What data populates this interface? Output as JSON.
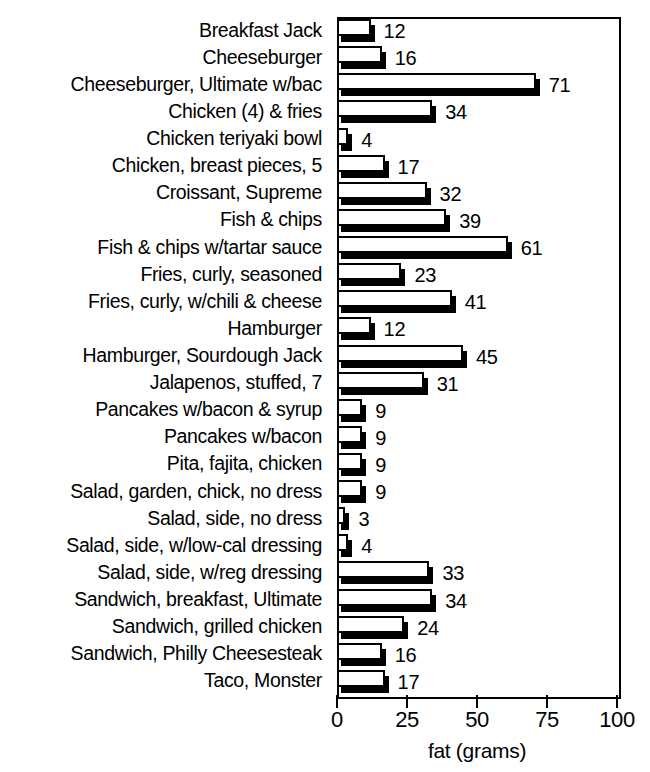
{
  "chart_data": {
    "type": "bar",
    "orientation": "horizontal",
    "title": "fat content in fast food",
    "title_cropped": true,
    "xlabel": "fat (grams)",
    "ylabel": "",
    "xlim": [
      0,
      100
    ],
    "xticks": [
      0,
      25,
      50,
      75,
      100
    ],
    "grid": false,
    "legend": null,
    "categories": [
      "Breakfast Jack",
      "Cheeseburger",
      "Cheeseburger, Ultimate w/bac",
      "Chicken (4) & fries",
      "Chicken teriyaki bowl",
      "Chicken, breast pieces, 5",
      "Croissant, Supreme",
      "Fish & chips",
      "Fish & chips w/tartar sauce",
      "Fries, curly, seasoned",
      "Fries, curly, w/chili & cheese",
      "Hamburger",
      "Hamburger, Sourdough Jack",
      "Jalapenos, stuffed, 7",
      "Pancakes w/bacon & syrup",
      "Pancakes w/bacon",
      "Pita, fajita, chicken",
      "Salad, garden, chick, no dress",
      "Salad, side, no dress",
      "Salad, side, w/low-cal dressing",
      "Salad, side, w/reg dressing",
      "Sandwich, breakfast, Ultimate",
      "Sandwich, grilled chicken",
      "Sandwich, Philly Cheesesteak",
      "Taco, Monster"
    ],
    "values": [
      12,
      16,
      71,
      34,
      4,
      17,
      32,
      39,
      61,
      23,
      41,
      12,
      45,
      31,
      9,
      9,
      9,
      9,
      3,
      4,
      33,
      34,
      24,
      16,
      17
    ],
    "value_labels": [
      "12",
      "16",
      "71",
      "34",
      "4",
      "17",
      "32",
      "39",
      "61",
      "23",
      "41",
      "12",
      "45",
      "31",
      "9",
      "9",
      "9",
      "9",
      "3",
      "4",
      "33",
      "34",
      "24",
      "16",
      "17"
    ],
    "xticklabels": [
      "0",
      "25",
      "50",
      "75",
      "100"
    ],
    "colors": {
      "bar_face": "#ffffff",
      "bar_outline": "#000000",
      "bar_shadow": "#000000",
      "axis": "#000000",
      "text": "#000000",
      "background": "#ffffff"
    }
  }
}
